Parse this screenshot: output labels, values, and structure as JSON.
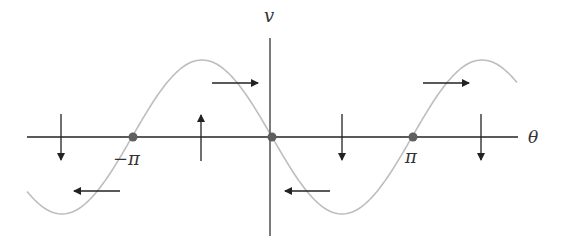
{
  "diagram": {
    "axes": {
      "x_label": "θ",
      "y_label": "v"
    },
    "ticks": {
      "neg_pi": "−π",
      "pi": "π"
    },
    "fixed_points": [
      {
        "name": "fixed-point-neg-pi",
        "theta": "−π"
      },
      {
        "name": "fixed-point-zero",
        "theta": "0"
      },
      {
        "name": "fixed-point-pi",
        "theta": "π"
      }
    ],
    "curve": {
      "type": "sinusoid",
      "expression": "v ∝ −sin θ",
      "color": "#bdbdbd"
    },
    "arrows": [
      {
        "direction": "down"
      },
      {
        "direction": "left"
      },
      {
        "direction": "up"
      },
      {
        "direction": "right"
      },
      {
        "direction": "left"
      },
      {
        "direction": "down"
      },
      {
        "direction": "right"
      },
      {
        "direction": "down"
      }
    ],
    "colors": {
      "axis": "#5a5a5a",
      "curve": "#bdbdbd",
      "dot": "#5f5f5f",
      "arrow": "#222222"
    }
  }
}
